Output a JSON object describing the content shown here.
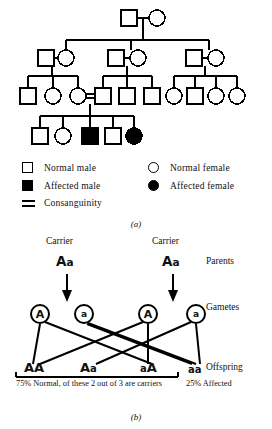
{
  "figure": {
    "panel_a": {
      "caption": "(a)",
      "type": "pedigree-chart",
      "description": "Pedigree showing autosomal recessive inheritance with a consanguineous mating",
      "generations": [
        {
          "generation": "I",
          "individuals": [
            {
              "id": "I-1",
              "sex": "male",
              "status": "normal"
            },
            {
              "id": "I-2",
              "sex": "female",
              "status": "normal"
            }
          ]
        },
        {
          "generation": "II",
          "individuals": [
            {
              "id": "II-1",
              "sex": "male",
              "status": "normal"
            },
            {
              "id": "II-2",
              "sex": "female",
              "status": "normal"
            },
            {
              "id": "II-3",
              "sex": "male",
              "status": "normal"
            },
            {
              "id": "II-4",
              "sex": "female",
              "status": "normal"
            },
            {
              "id": "II-5",
              "sex": "male",
              "status": "normal"
            },
            {
              "id": "II-6",
              "sex": "female",
              "status": "normal"
            }
          ]
        },
        {
          "generation": "III",
          "individuals": [
            {
              "id": "III-1",
              "sex": "male",
              "status": "normal"
            },
            {
              "id": "III-2",
              "sex": "female",
              "status": "normal"
            },
            {
              "id": "III-3",
              "sex": "female",
              "status": "normal",
              "consanguineous": true
            },
            {
              "id": "III-4",
              "sex": "male",
              "status": "normal",
              "consanguineous": true
            },
            {
              "id": "III-5",
              "sex": "male",
              "status": "normal"
            },
            {
              "id": "III-6",
              "sex": "male",
              "status": "normal"
            },
            {
              "id": "III-7",
              "sex": "female",
              "status": "normal"
            },
            {
              "id": "III-8",
              "sex": "male",
              "status": "normal"
            },
            {
              "id": "III-9",
              "sex": "female",
              "status": "normal"
            },
            {
              "id": "III-10",
              "sex": "female",
              "status": "normal"
            }
          ]
        },
        {
          "generation": "IV",
          "individuals": [
            {
              "id": "IV-1",
              "sex": "male",
              "status": "normal"
            },
            {
              "id": "IV-2",
              "sex": "female",
              "status": "normal"
            },
            {
              "id": "IV-3",
              "sex": "male",
              "status": "affected"
            },
            {
              "id": "IV-4",
              "sex": "male",
              "status": "normal"
            },
            {
              "id": "IV-5",
              "sex": "female",
              "status": "affected"
            }
          ]
        }
      ]
    },
    "legend": {
      "items": [
        {
          "symbol": "square-open",
          "label": "Normal male"
        },
        {
          "symbol": "circle-open",
          "label": "Normal female"
        },
        {
          "symbol": "square-filled",
          "label": "Affected male"
        },
        {
          "symbol": "circle-filled",
          "label": "Affected female"
        },
        {
          "symbol": "double-line",
          "label": "Consanguinity"
        }
      ]
    },
    "panel_b": {
      "caption": "(b)",
      "type": "monohybrid-cross",
      "row_labels": {
        "parents": "Parents",
        "gametes": "Gametes",
        "offspring": "Offspring"
      },
      "parents": [
        {
          "title": "Carrier",
          "allele_dominant": "A",
          "allele_recessive": "a"
        },
        {
          "title": "Carrier",
          "allele_dominant": "A",
          "allele_recessive": "a"
        }
      ],
      "gametes": [
        {
          "allele": "A",
          "type": "dominant",
          "parent": "left"
        },
        {
          "allele": "a",
          "type": "recessive",
          "parent": "left"
        },
        {
          "allele": "A",
          "type": "dominant",
          "parent": "right"
        },
        {
          "allele": "a",
          "type": "recessive",
          "parent": "right"
        }
      ],
      "offspring": [
        {
          "dominant": "A",
          "recessive": "A",
          "phenotype": "normal"
        },
        {
          "dominant": "A",
          "recessive": "a",
          "phenotype": "carrier"
        },
        {
          "dominant": "a",
          "recessive": "A",
          "phenotype": "carrier"
        },
        {
          "dominant": "a",
          "recessive": "a",
          "phenotype": "affected"
        }
      ],
      "notes": {
        "normal": "75% Normal, of these 2 out of 3 are carriers",
        "affected": "25% Affected"
      }
    }
  }
}
